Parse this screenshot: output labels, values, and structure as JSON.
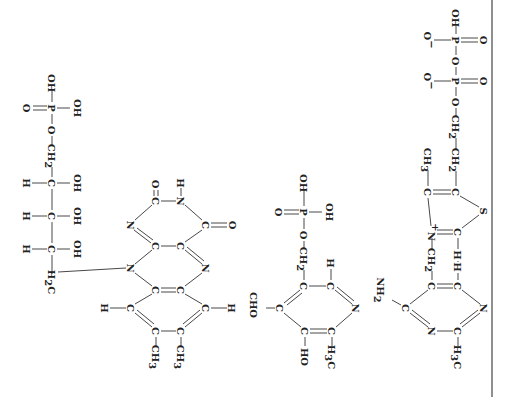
{
  "figure": {
    "orientation": "rotated-90-clockwise",
    "page_border": {
      "x": 492,
      "color": "#444444"
    },
    "ink_color": "#222222",
    "background": "#ffffff"
  },
  "structures": [
    {
      "name": "flavin-mononucleotide",
      "atoms": [
        {
          "id": "p1_oh_top",
          "label": "OH",
          "x": 52,
          "y": 83
        },
        {
          "id": "p1_p",
          "label": "P",
          "x": 52,
          "y": 108
        },
        {
          "id": "p1_o_dbl",
          "label": "O",
          "x": 27,
          "y": 108
        },
        {
          "id": "p1_oh_right",
          "label": "OH",
          "x": 78,
          "y": 108
        },
        {
          "id": "p1_o",
          "label": "O",
          "x": 52,
          "y": 130
        },
        {
          "id": "p1_ch2",
          "label": "CH",
          "sub": "2",
          "x": 52,
          "y": 156
        },
        {
          "id": "r1_c1",
          "label": "C",
          "x": 52,
          "y": 183
        },
        {
          "id": "r1_h1",
          "label": "H",
          "x": 27,
          "y": 183
        },
        {
          "id": "r1_oh1",
          "label": "OH",
          "x": 78,
          "y": 183
        },
        {
          "id": "r1_c2",
          "label": "C",
          "x": 52,
          "y": 216
        },
        {
          "id": "r1_h2",
          "label": "H",
          "x": 27,
          "y": 216
        },
        {
          "id": "r1_oh2",
          "label": "OH",
          "x": 78,
          "y": 216
        },
        {
          "id": "r1_c3",
          "label": "C",
          "x": 52,
          "y": 249
        },
        {
          "id": "r1_h3",
          "label": "H",
          "x": 27,
          "y": 249
        },
        {
          "id": "r1_oh3",
          "label": "OH",
          "x": 78,
          "y": 249
        },
        {
          "id": "r1_h2c",
          "label": "H",
          "sub": "2",
          "tail": "C",
          "x": 52,
          "y": 282
        },
        {
          "id": "f_o_top",
          "label": "O",
          "x": 156,
          "y": 184
        },
        {
          "id": "f_h_top",
          "label": "H",
          "x": 181,
          "y": 183
        },
        {
          "id": "f_c_a",
          "label": "C",
          "x": 156,
          "y": 201
        },
        {
          "id": "f_n_a",
          "label": "N",
          "x": 181,
          "y": 201
        },
        {
          "id": "f_n_b",
          "label": "N",
          "x": 131,
          "y": 225
        },
        {
          "id": "f_c_b",
          "label": "C",
          "x": 206,
          "y": 225
        },
        {
          "id": "f_o_right",
          "label": "O",
          "x": 233,
          "y": 225
        },
        {
          "id": "f_c_c",
          "label": "C",
          "x": 156,
          "y": 246
        },
        {
          "id": "f_c_d",
          "label": "C",
          "x": 181,
          "y": 246
        },
        {
          "id": "f_n_c",
          "label": "N",
          "x": 131,
          "y": 268
        },
        {
          "id": "f_n_d",
          "label": "N",
          "x": 206,
          "y": 268
        },
        {
          "id": "f_c_e",
          "label": "C",
          "x": 156,
          "y": 290
        },
        {
          "id": "f_c_f",
          "label": "C",
          "x": 181,
          "y": 290
        },
        {
          "id": "f_c_g",
          "label": "C",
          "x": 131,
          "y": 308
        },
        {
          "id": "f_h_g",
          "label": "H",
          "x": 105,
          "y": 308
        },
        {
          "id": "f_c_h",
          "label": "C",
          "x": 206,
          "y": 308
        },
        {
          "id": "f_h_h",
          "label": "H",
          "x": 232,
          "y": 308
        },
        {
          "id": "f_c_i",
          "label": "C",
          "x": 156,
          "y": 331
        },
        {
          "id": "f_c_j",
          "label": "C",
          "x": 181,
          "y": 331
        },
        {
          "id": "f_ch3_i",
          "label": "CH",
          "sub": "3",
          "x": 156,
          "y": 357
        },
        {
          "id": "f_ch3_j",
          "label": "CH",
          "sub": "3",
          "x": 181,
          "y": 357
        }
      ]
    },
    {
      "name": "pyridoxal-phosphate",
      "atoms": [
        {
          "id": "p2_oh_top",
          "label": "OH",
          "x": 304,
          "y": 183
        },
        {
          "id": "p2_p",
          "label": "P",
          "x": 304,
          "y": 212
        },
        {
          "id": "p2_o_dbl",
          "label": "O",
          "x": 279,
          "y": 212
        },
        {
          "id": "p2_oh_right",
          "label": "OH",
          "x": 330,
          "y": 212
        },
        {
          "id": "p2_o",
          "label": "O",
          "x": 304,
          "y": 235
        },
        {
          "id": "p2_ch2",
          "label": "CH",
          "sub": "2",
          "x": 304,
          "y": 259
        },
        {
          "id": "py_c_a",
          "label": "C",
          "x": 304,
          "y": 286
        },
        {
          "id": "py_c_b",
          "label": "C",
          "x": 331,
          "y": 286
        },
        {
          "id": "py_h_b",
          "label": "H",
          "x": 331,
          "y": 263
        },
        {
          "id": "py_cho",
          "label": "CHO",
          "x": 254,
          "y": 305
        },
        {
          "id": "py_c_c",
          "label": "C",
          "x": 280,
          "y": 308
        },
        {
          "id": "py_n",
          "label": "N",
          "x": 356,
          "y": 308
        },
        {
          "id": "py_c_d",
          "label": "C",
          "x": 305,
          "y": 331
        },
        {
          "id": "py_c_e",
          "label": "C",
          "x": 332,
          "y": 331
        },
        {
          "id": "py_ho",
          "label": "HO",
          "x": 305,
          "y": 357
        },
        {
          "id": "py_h3c",
          "label": "H",
          "sub": "3",
          "tail": "C",
          "x": 332,
          "y": 357
        }
      ]
    },
    {
      "name": "thiamine-pyrophosphate",
      "atoms": [
        {
          "id": "t_oh_top",
          "label": "OH",
          "x": 456,
          "y": 18
        },
        {
          "id": "t_p1",
          "label": "P",
          "x": 456,
          "y": 40
        },
        {
          "id": "t_om1",
          "label": "O",
          "sup": "−",
          "x": 428,
          "y": 40
        },
        {
          "id": "t_od1",
          "label": "O",
          "x": 484,
          "y": 40
        },
        {
          "id": "t_o_bridge",
          "label": "O",
          "x": 456,
          "y": 61
        },
        {
          "id": "t_p2",
          "label": "P",
          "x": 456,
          "y": 81
        },
        {
          "id": "t_om2",
          "label": "O",
          "sup": "−",
          "x": 428,
          "y": 81
        },
        {
          "id": "t_od2",
          "label": "O",
          "x": 484,
          "y": 81
        },
        {
          "id": "t_o_ester",
          "label": "O",
          "x": 456,
          "y": 102
        },
        {
          "id": "t_ch2_a",
          "label": "CH",
          "sub": "2",
          "x": 456,
          "y": 127
        },
        {
          "id": "t_ch2_b",
          "label": "CH",
          "sub": "2",
          "x": 456,
          "y": 160
        },
        {
          "id": "t_c_thz1",
          "label": "C",
          "x": 456,
          "y": 192
        },
        {
          "id": "t_c_thz2",
          "label": "C",
          "x": 428,
          "y": 192
        },
        {
          "id": "t_ch3_thz",
          "label": "CH",
          "sub": "3",
          "x": 428,
          "y": 160
        },
        {
          "id": "t_s",
          "label": "S",
          "x": 484,
          "y": 211
        },
        {
          "id": "t_nplus",
          "label": "N",
          "sup": "+",
          "x": 432,
          "y": 232
        },
        {
          "id": "t_c_thz3",
          "label": "C",
          "x": 458,
          "y": 232
        },
        {
          "id": "t_h_thz3",
          "label": "H",
          "x": 458,
          "y": 255
        },
        {
          "id": "t_ch2_link",
          "label": "CH",
          "sub": "2",
          "x": 432,
          "y": 260
        },
        {
          "id": "t_nh2",
          "label": "NH",
          "sub": "2",
          "x": 381,
          "y": 290
        },
        {
          "id": "t_pm_c_a",
          "label": "C",
          "x": 432,
          "y": 286
        },
        {
          "id": "t_pm_c_b",
          "label": "C",
          "x": 458,
          "y": 286
        },
        {
          "id": "t_pm_h_b",
          "label": "H",
          "x": 458,
          "y": 267
        },
        {
          "id": "t_pm_c_nh2",
          "label": "C",
          "x": 406,
          "y": 308
        },
        {
          "id": "t_pm_n_right",
          "label": "N",
          "x": 484,
          "y": 308
        },
        {
          "id": "t_pm_n_bot",
          "label": "N",
          "x": 432,
          "y": 331
        },
        {
          "id": "t_pm_c_me",
          "label": "C",
          "x": 458,
          "y": 331
        },
        {
          "id": "t_pm_h3c",
          "label": "H",
          "sub": "3",
          "tail": "C",
          "x": 458,
          "y": 357
        }
      ]
    }
  ]
}
